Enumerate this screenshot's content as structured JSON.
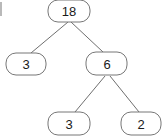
{
  "diagram": {
    "type": "binary-tree",
    "background_color": "#ffffff",
    "node_fill_color": "#ffffff",
    "node_stroke_color": "#777777",
    "edge_color": "#6f6f6f",
    "label_color": "#1a1a1a",
    "nodes": [
      {
        "id": "root",
        "label": "18",
        "cx": 69,
        "cy": 11,
        "w": 42,
        "h": 22,
        "rx": 10
      },
      {
        "id": "left",
        "label": "3",
        "cx": 26,
        "cy": 64,
        "w": 40,
        "h": 22,
        "rx": 10
      },
      {
        "id": "right",
        "label": "6",
        "cx": 107,
        "cy": 64,
        "w": 41,
        "h": 23,
        "rx": 10
      },
      {
        "id": "right-left",
        "label": "3",
        "cx": 69,
        "cy": 123,
        "w": 42,
        "h": 23,
        "rx": 10
      },
      {
        "id": "right-right",
        "label": "2",
        "cx": 141,
        "cy": 123,
        "w": 40,
        "h": 23,
        "rx": 10
      }
    ],
    "edges": [
      {
        "id": "edge-root-left",
        "from": "root",
        "to": "left",
        "x1": 68,
        "y1": 22,
        "x2": 31,
        "y2": 53
      },
      {
        "id": "edge-root-right",
        "from": "root",
        "to": "right",
        "x1": 71,
        "y1": 22,
        "x2": 103,
        "y2": 52
      },
      {
        "id": "edge-right-left",
        "from": "right",
        "to": "right-left",
        "x1": 105,
        "y1": 76,
        "x2": 75,
        "y2": 112
      },
      {
        "id": "edge-right-right",
        "from": "right",
        "to": "right-right",
        "x1": 110,
        "y1": 76,
        "x2": 139,
        "y2": 112
      }
    ],
    "artifact": {
      "id": "scan-edge-mark",
      "x": 0,
      "y": 2,
      "w": 2,
      "h": 14
    }
  }
}
